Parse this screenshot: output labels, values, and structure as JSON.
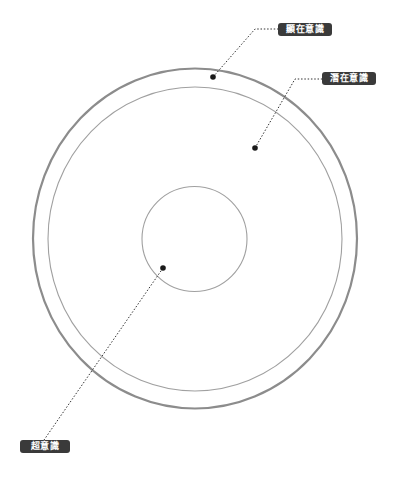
{
  "diagram": {
    "title": "",
    "labels": {
      "conscious": "顯在意識",
      "subconscious": "潛在意識",
      "superconscious": "超意識"
    },
    "colors": {
      "outer_ring": "#8c8c8c",
      "inner_ring": "#9a9a9a",
      "core_ring": "#9a9a9a",
      "leader_line": "#333333",
      "dot": "#1a1a1a",
      "label_bg": "#3a3a3a",
      "label_text": "#ffffff"
    },
    "structure": [
      {
        "layer": "outer ring (thick)",
        "label": "顯在意識"
      },
      {
        "layer": "inner large circle",
        "label": "潛在意識"
      },
      {
        "layer": "core small circle",
        "label": "超意識"
      }
    ]
  }
}
